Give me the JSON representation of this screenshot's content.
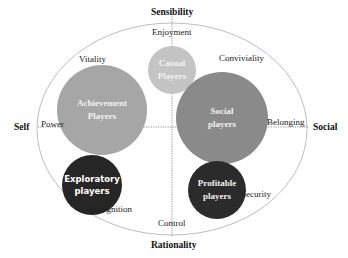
{
  "diagram": {
    "axes": {
      "top": "Sensibility",
      "bottom": "Rationality",
      "left": "Self",
      "right": "Social"
    },
    "motivations": {
      "top": "Enjoyment",
      "top_left": "Vitality",
      "top_right": "Conviviality",
      "left": "Power",
      "right": "Belonging",
      "bottom_left": "Recognition",
      "bottom": "Control",
      "bottom_right": "Security"
    },
    "player_types": [
      {
        "line1": "Casual",
        "line2": "Players",
        "color": "#c4c4c4"
      },
      {
        "line1": "Achievement",
        "line2": "Players",
        "color": "#a6a6a6"
      },
      {
        "line1": "Social",
        "line2": "players",
        "color": "#8a8a8a"
      },
      {
        "line1": "Exploratory",
        "line2": "players",
        "color": "#262626"
      },
      {
        "line1": "Profitable",
        "line2": "players",
        "color": "#2b2b2b"
      }
    ],
    "colors": {
      "ellipse_stroke": "#b5b5b5",
      "axis_line": "#7a7a7a",
      "background": "#ffffff"
    }
  }
}
